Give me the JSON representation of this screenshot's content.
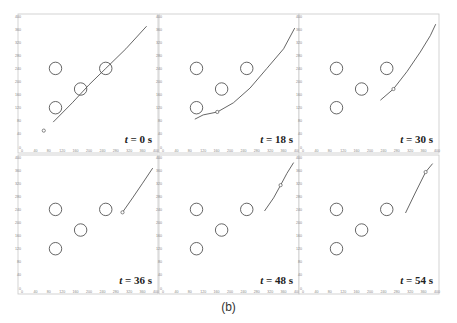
{
  "figure": {
    "caption": "(b)",
    "axis": {
      "xlim": [
        0,
        400
      ],
      "ylim": [
        0,
        400
      ],
      "x_ticks": [
        "0",
        "40",
        "80",
        "120",
        "160",
        "200",
        "240",
        "280",
        "320",
        "360",
        "400"
      ],
      "y_ticks": [
        "0",
        "40",
        "80",
        "120",
        "160",
        "200",
        "240",
        "280",
        "320",
        "360",
        "400"
      ],
      "x_label_fragment": "g-240"
    },
    "colors": {
      "line": "#555555",
      "circle": "#555555",
      "frame": "#c8c8c8",
      "tick_text": "#888888",
      "time_label": "#222222"
    },
    "obstacles": [
      {
        "x": 100,
        "y": 240,
        "r": 12
      },
      {
        "x": 175,
        "y": 177,
        "r": 12
      },
      {
        "x": 250,
        "y": 240,
        "r": 12
      },
      {
        "x": 100,
        "y": 120,
        "r": 12
      }
    ],
    "panels": [
      {
        "time_label": "t = 0 s",
        "path": [
          [
            93,
            76
          ],
          [
            150,
            135
          ],
          [
            200,
            190
          ],
          [
            250,
            240
          ],
          [
            310,
            300
          ],
          [
            372,
            369
          ]
        ],
        "marker": [
          65,
          50
        ]
      },
      {
        "time_label": "t = 18 s",
        "path": [
          [
            95,
            85
          ],
          [
            120,
            98
          ],
          [
            162,
            107
          ],
          [
            210,
            135
          ],
          [
            260,
            180
          ],
          [
            310,
            240
          ],
          [
            360,
            300
          ],
          [
            393,
            363
          ]
        ],
        "marker": [
          162,
          107
        ]
      },
      {
        "time_label": "t = 30 s",
        "path": [
          [
            231,
            143
          ],
          [
            270,
            177
          ],
          [
            310,
            230
          ],
          [
            350,
            290
          ],
          [
            380,
            340
          ],
          [
            396,
            375
          ]
        ],
        "marker": [
          270,
          177
        ]
      },
      {
        "time_label": "t = 36 s",
        "path": [
          [
            300,
            231
          ],
          [
            330,
            275
          ],
          [
            360,
            320
          ],
          [
            390,
            366
          ]
        ],
        "marker": [
          300,
          231
        ]
      },
      {
        "time_label": "t = 48 s",
        "path": [
          [
            303,
            235
          ],
          [
            330,
            275
          ],
          [
            351,
            314
          ],
          [
            370,
            350
          ],
          [
            390,
            383
          ]
        ],
        "marker": [
          351,
          314
        ]
      },
      {
        "time_label": "t = 54 s",
        "path": [
          [
            306,
            229
          ],
          [
            335,
            290
          ],
          [
            366,
            354
          ],
          [
            387,
            380
          ]
        ],
        "marker": [
          366,
          354
        ]
      }
    ]
  },
  "chart_data": {
    "type": "scatter",
    "title": "",
    "caption": "(b)",
    "xlabel": "",
    "ylabel": "",
    "xlim": [
      0,
      400
    ],
    "ylim": [
      0,
      400
    ],
    "grid": false,
    "x_ticks": [
      0,
      40,
      80,
      120,
      160,
      200,
      240,
      280,
      320,
      360,
      400
    ],
    "y_ticks": [
      0,
      40,
      80,
      120,
      160,
      200,
      240,
      280,
      320,
      360,
      400
    ],
    "static_circles": [
      [
        100,
        240
      ],
      [
        175,
        177
      ],
      [
        250,
        240
      ],
      [
        100,
        120
      ]
    ],
    "snapshots": [
      {
        "t": "0 s",
        "trajectory": [
          [
            93,
            76
          ],
          [
            372,
            369
          ]
        ],
        "marker": [
          65,
          50
        ]
      },
      {
        "t": "18 s",
        "trajectory": [
          [
            95,
            85
          ],
          [
            162,
            107
          ],
          [
            393,
            363
          ]
        ],
        "marker": [
          162,
          107
        ]
      },
      {
        "t": "30 s",
        "trajectory": [
          [
            231,
            143
          ],
          [
            270,
            177
          ],
          [
            396,
            375
          ]
        ],
        "marker": [
          270,
          177
        ]
      },
      {
        "t": "36 s",
        "trajectory": [
          [
            300,
            231
          ],
          [
            390,
            366
          ]
        ],
        "marker": [
          300,
          231
        ]
      },
      {
        "t": "48 s",
        "trajectory": [
          [
            303,
            235
          ],
          [
            351,
            314
          ],
          [
            390,
            383
          ]
        ],
        "marker": [
          351,
          314
        ]
      },
      {
        "t": "54 s",
        "trajectory": [
          [
            306,
            229
          ],
          [
            366,
            354
          ],
          [
            387,
            380
          ]
        ],
        "marker": [
          366,
          354
        ]
      }
    ]
  }
}
